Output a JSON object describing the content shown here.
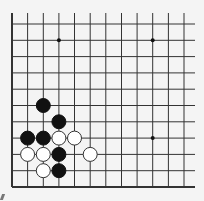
{
  "board": {
    "colors": {
      "background": "#f4f4f4",
      "line": "#333333",
      "black_stone": "#111111",
      "white_stone": "#ffffff",
      "white_stone_border": "#333333",
      "star_point": "#111111"
    },
    "columns_x": [
      12,
      27.6,
      43.3,
      58.9,
      74.5,
      90.2,
      105.8,
      121.5,
      137.1,
      152.7,
      168.4,
      184
    ],
    "rows_y": [
      24,
      40.3,
      56.6,
      72.9,
      89.2,
      105.5,
      121.8,
      138.1,
      154.4,
      170.7,
      187
    ],
    "vertical_line_top": 13,
    "horizontal_line_right": 195,
    "stone_radius": 7,
    "star_points": [
      {
        "col": 3,
        "row": 1
      },
      {
        "col": 9,
        "row": 1
      },
      {
        "col": 9,
        "row": 7
      }
    ],
    "stones": [
      {
        "color": "black",
        "col": 2,
        "row": 5
      },
      {
        "color": "black",
        "col": 3,
        "row": 6
      },
      {
        "color": "black",
        "col": 1,
        "row": 7
      },
      {
        "color": "black",
        "col": 2,
        "row": 7
      },
      {
        "color": "white",
        "col": 3,
        "row": 7
      },
      {
        "color": "white",
        "col": 4,
        "row": 7
      },
      {
        "color": "white",
        "col": 1,
        "row": 8
      },
      {
        "color": "white",
        "col": 2,
        "row": 8
      },
      {
        "color": "black",
        "col": 3,
        "row": 8
      },
      {
        "color": "white",
        "col": 5,
        "row": 8
      },
      {
        "color": "white",
        "col": 2,
        "row": 9
      },
      {
        "color": "black",
        "col": 3,
        "row": 9
      }
    ]
  }
}
